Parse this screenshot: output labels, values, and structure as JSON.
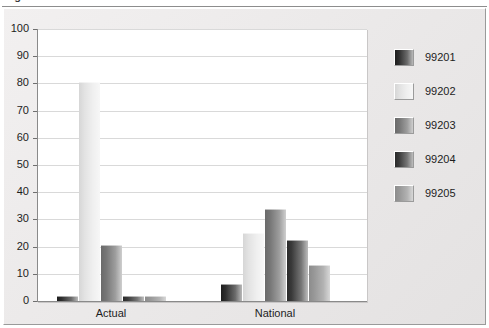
{
  "figure": {
    "caption": "Figure 3.  New Patient Office Visit Utilization",
    "caption_clipped": true
  },
  "chart_data": {
    "type": "bar",
    "title": "",
    "xlabel": "",
    "ylabel": "",
    "categories": [
      "Actual",
      "National"
    ],
    "series": [
      {
        "name": "99201",
        "key": "s1",
        "color": "#2e2e2e",
        "values": [
          1.5,
          6.0
        ]
      },
      {
        "name": "99202",
        "key": "s2",
        "color": "#e8e8e8",
        "values": [
          80.0,
          24.7
        ]
      },
      {
        "name": "99203",
        "key": "s3",
        "color": "#8a8a8a",
        "values": [
          20.3,
          33.5
        ]
      },
      {
        "name": "99204",
        "key": "s4",
        "color": "#3a3a3a",
        "values": [
          1.5,
          22.0
        ]
      },
      {
        "name": "99205",
        "key": "s5",
        "color": "#a8a8a8",
        "values": [
          1.5,
          12.8
        ]
      }
    ],
    "ylim": [
      0,
      100
    ],
    "ytick_step": 10,
    "yticks": [
      "0",
      "10",
      "20",
      "30",
      "40",
      "50",
      "60",
      "70",
      "80",
      "90",
      "100"
    ],
    "grid": true,
    "legend_position": "right",
    "legend_entries": [
      "99201",
      "99202",
      "99203",
      "99204",
      "99205"
    ]
  },
  "colors": {
    "panel_background": "#ecebeb",
    "plot_background": "#ffffff",
    "gridline": "#d9d9d9",
    "axis": "#8a8a8a",
    "text": "#1d1d1d"
  }
}
